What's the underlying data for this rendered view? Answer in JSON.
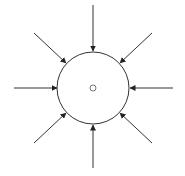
{
  "diagram": {
    "background": "#ffffff",
    "stroke_color": "#333333",
    "center_marker_color": "#555555",
    "outer_circle": {
      "cx": 93,
      "cy": 88,
      "r": 36
    },
    "center_point": {
      "cx": 93,
      "cy": 88,
      "r": 3
    },
    "arrows": [
      {
        "name": "top",
        "x1": 93,
        "y1": 5,
        "x2": 93,
        "y2": 51
      },
      {
        "name": "top-right",
        "x1": 152,
        "y1": 33,
        "x2": 120,
        "y2": 63
      },
      {
        "name": "right",
        "x1": 173,
        "y1": 88,
        "x2": 130,
        "y2": 88
      },
      {
        "name": "bottom-right",
        "x1": 152,
        "y1": 143,
        "x2": 120,
        "y2": 113
      },
      {
        "name": "bottom",
        "x1": 93,
        "y1": 168,
        "x2": 93,
        "y2": 125
      },
      {
        "name": "bottom-left",
        "x1": 34,
        "y1": 143,
        "x2": 66,
        "y2": 113
      },
      {
        "name": "left",
        "x1": 14,
        "y1": 88,
        "x2": 57,
        "y2": 88
      },
      {
        "name": "top-left",
        "x1": 34,
        "y1": 33,
        "x2": 66,
        "y2": 63
      }
    ]
  }
}
